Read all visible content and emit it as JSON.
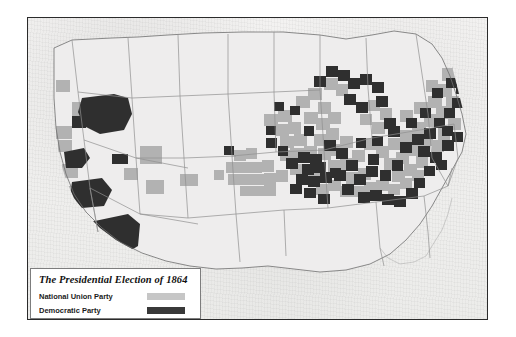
{
  "map": {
    "title": "The Presidential Election of 1864",
    "legend": [
      {
        "label": "National Union Party",
        "color": "#c6c6c6",
        "swatch": "union-swatch"
      },
      {
        "label": "Democratic Party",
        "color": "#393939",
        "swatch": "democratic-swatch"
      }
    ],
    "colors": {
      "background": "#f0efee",
      "frame": "#2b2b2b",
      "state_border": "#8b8b8b",
      "national_union": "#b2b2b2",
      "democratic": "#2f2f2f",
      "unshaded": "#efeeec",
      "legend_background": "#ffffff",
      "legend_border": "#7d7d7d"
    },
    "regions": {
      "shaded_light_note": "National Union Party counties",
      "shaded_dark_note": "Democratic Party counties",
      "unshaded_note": "Confederate states did not participate"
    }
  }
}
